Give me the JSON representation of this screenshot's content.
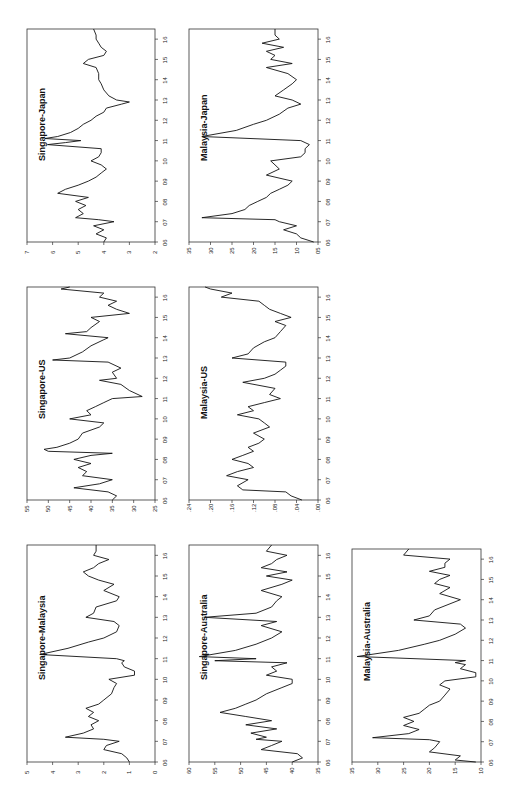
{
  "figure": {
    "orientation": "rotated-90-ccw",
    "line_color": "#111111",
    "frame_color": "#333333"
  },
  "chart_data": [
    {
      "type": "line",
      "title": "Singapore-Japan",
      "panel_box": {
        "x": 27,
        "y": 29,
        "w": 128,
        "h": 213
      },
      "ylim": [
        2,
        7
      ],
      "yticks": [
        2,
        3,
        4,
        5,
        6,
        7
      ],
      "ytick_labels": [
        "2",
        "3",
        "4",
        "5",
        "6",
        "7"
      ],
      "xlim": [
        2006,
        2016.5
      ],
      "xtick_labels": [
        "06",
        "07",
        "08",
        "09",
        "10",
        "11",
        "12",
        "13",
        "14",
        "15",
        "16"
      ],
      "x": [
        2006.0,
        2006.2,
        2006.4,
        2006.6,
        2006.8,
        2007.0,
        2007.1,
        2007.2,
        2007.4,
        2007.6,
        2007.8,
        2008.0,
        2008.2,
        2008.4,
        2008.6,
        2008.8,
        2009.0,
        2009.2,
        2009.4,
        2009.6,
        2009.8,
        2010.0,
        2010.2,
        2010.4,
        2010.6,
        2010.8,
        2010.9,
        2011.0,
        2011.1,
        2011.2,
        2011.4,
        2011.6,
        2011.8,
        2012.0,
        2012.2,
        2012.4,
        2012.6,
        2012.8,
        2012.9,
        2013.0,
        2013.2,
        2013.5,
        2013.8,
        2014.0,
        2014.3,
        2014.6,
        2014.8,
        2015.0,
        2015.2,
        2015.4,
        2015.6,
        2015.8,
        2016.0,
        2016.2,
        2016.5
      ],
      "values": [
        4.0,
        3.9,
        4.3,
        4.0,
        4.4,
        3.6,
        4.2,
        5.1,
        4.8,
        5.0,
        4.7,
        5.1,
        4.6,
        5.8,
        5.5,
        5.0,
        4.6,
        4.3,
        4.1,
        3.9,
        4.1,
        4.5,
        4.2,
        4.1,
        4.1,
        6.2,
        5.5,
        4.9,
        6.3,
        5.8,
        5.3,
        5.0,
        4.8,
        4.5,
        4.3,
        4.0,
        3.9,
        3.3,
        3.0,
        3.5,
        3.8,
        4.0,
        4.1,
        4.2,
        4.2,
        4.3,
        4.8,
        4.6,
        4.0,
        3.9,
        4.1,
        4.2,
        4.3,
        4.3,
        4.4
      ],
      "xlabel": "",
      "ylabel": ""
    },
    {
      "type": "line",
      "title": "Singapore-US",
      "panel_box": {
        "x": 27,
        "y": 287,
        "w": 128,
        "h": 213
      },
      "ylim": [
        25,
        55
      ],
      "yticks": [
        25,
        30,
        35,
        40,
        45,
        50,
        55
      ],
      "ytick_labels": [
        "25",
        "30",
        "35",
        "40",
        "45",
        "50",
        "55"
      ],
      "xlim": [
        2006,
        2016.5
      ],
      "xtick_labels": [
        "06",
        "07",
        "08",
        "09",
        "10",
        "11",
        "12",
        "13",
        "14",
        "15",
        "16"
      ],
      "x": [
        2006.0,
        2006.2,
        2006.4,
        2006.6,
        2006.8,
        2007.0,
        2007.2,
        2007.4,
        2007.6,
        2007.8,
        2008.0,
        2008.2,
        2008.3,
        2008.4,
        2008.5,
        2008.6,
        2008.8,
        2009.0,
        2009.3,
        2009.6,
        2009.8,
        2010.0,
        2010.2,
        2010.4,
        2010.6,
        2010.8,
        2011.0,
        2011.1,
        2011.4,
        2011.7,
        2011.9,
        2012.0,
        2012.3,
        2012.5,
        2012.8,
        2012.9,
        2013.0,
        2013.3,
        2013.6,
        2013.9,
        2014.0,
        2014.2,
        2014.3,
        2014.5,
        2014.8,
        2015.0,
        2015.2,
        2015.4,
        2015.6,
        2015.8,
        2016.0,
        2016.2,
        2016.4,
        2016.5
      ],
      "values": [
        35,
        34,
        36,
        44,
        38,
        35,
        42,
        41,
        43,
        40,
        44,
        40,
        35,
        50,
        51,
        48,
        45,
        43,
        42,
        38,
        37,
        45,
        40,
        41,
        39,
        37,
        35,
        28,
        31,
        33,
        38,
        34,
        35,
        33,
        36,
        49,
        45,
        42,
        40,
        37,
        36,
        46,
        41,
        40,
        38,
        40,
        31,
        34,
        36,
        34,
        38,
        37,
        47,
        45
      ],
      "xlabel": "",
      "ylabel": ""
    },
    {
      "type": "line",
      "title": "Singapore-Malaysia",
      "panel_box": {
        "x": 27,
        "y": 545,
        "w": 128,
        "h": 217
      },
      "ylim": [
        0,
        5
      ],
      "yticks": [
        0,
        1,
        2,
        3,
        4,
        5
      ],
      "ytick_labels": [
        "0",
        "1",
        "2",
        "3",
        "4",
        "5"
      ],
      "xlim": [
        2006,
        2016.5
      ],
      "xtick_labels": [
        "06",
        "07",
        "08",
        "09",
        "10",
        "11",
        "12",
        "13",
        "14",
        "15",
        "16"
      ],
      "x": [
        2006.0,
        2006.2,
        2006.4,
        2006.6,
        2006.8,
        2007.0,
        2007.1,
        2007.2,
        2007.4,
        2007.6,
        2007.8,
        2008.0,
        2008.2,
        2008.4,
        2008.6,
        2008.8,
        2009.0,
        2009.3,
        2009.6,
        2009.8,
        2010.0,
        2010.2,
        2010.4,
        2010.6,
        2010.8,
        2010.9,
        2011.0,
        2011.2,
        2011.5,
        2011.8,
        2012.0,
        2012.3,
        2012.6,
        2012.8,
        2013.0,
        2013.2,
        2013.5,
        2013.8,
        2014.0,
        2014.3,
        2014.6,
        2014.8,
        2015.0,
        2015.2,
        2015.4,
        2015.6,
        2015.8,
        2016.0,
        2016.2,
        2016.5
      ],
      "values": [
        1.0,
        1.1,
        1.3,
        2.0,
        1.9,
        1.4,
        2.0,
        3.5,
        2.8,
        2.4,
        2.5,
        2.2,
        2.6,
        2.4,
        2.7,
        2.2,
        2.0,
        1.7,
        1.6,
        1.5,
        1.8,
        0.8,
        0.8,
        1.2,
        1.3,
        1.2,
        1.5,
        4.5,
        3.4,
        2.6,
        2.0,
        1.5,
        1.4,
        1.6,
        2.7,
        2.4,
        2.3,
        1.5,
        1.4,
        2.0,
        1.6,
        2.2,
        2.6,
        2.8,
        2.4,
        2.2,
        1.8,
        2.4,
        2.3,
        2.3
      ],
      "xlabel": "",
      "ylabel": ""
    },
    {
      "type": "line",
      "title": "Malaysia-Japan",
      "panel_box": {
        "x": 189,
        "y": 29,
        "w": 129,
        "h": 213
      },
      "ylim": [
        5,
        35
      ],
      "yticks": [
        5,
        10,
        15,
        20,
        25,
        30,
        35
      ],
      "ytick_labels": [
        "05",
        "10",
        "15",
        "20",
        "25",
        "30",
        "35"
      ],
      "xlim": [
        2006,
        2016.5
      ],
      "xtick_labels": [
        "06",
        "07",
        "08",
        "09",
        "10",
        "11",
        "12",
        "13",
        "14",
        "15",
        "16"
      ],
      "x": [
        2006.0,
        2006.2,
        2006.4,
        2006.6,
        2006.8,
        2007.0,
        2007.1,
        2007.2,
        2007.4,
        2007.6,
        2007.8,
        2008.0,
        2008.2,
        2008.4,
        2008.6,
        2008.8,
        2009.0,
        2009.3,
        2009.6,
        2009.8,
        2010.0,
        2010.2,
        2010.4,
        2010.6,
        2010.8,
        2010.9,
        2011.0,
        2011.2,
        2011.5,
        2011.8,
        2012.0,
        2012.3,
        2012.6,
        2012.8,
        2013.0,
        2013.2,
        2013.5,
        2013.8,
        2014.0,
        2014.3,
        2014.6,
        2014.8,
        2015.0,
        2015.2,
        2015.4,
        2015.6,
        2015.8,
        2016.0,
        2016.2,
        2016.5
      ],
      "values": [
        6,
        9,
        10,
        13,
        10,
        14,
        15,
        32,
        25,
        22,
        21,
        19,
        17,
        16,
        14,
        12,
        11,
        17,
        14,
        15,
        16,
        9,
        8,
        8,
        7,
        8,
        9,
        32,
        24,
        20,
        17,
        14,
        12,
        9,
        11,
        15,
        13,
        11,
        10,
        12,
        17,
        11,
        16,
        15,
        17,
        13,
        18,
        14,
        15,
        15
      ],
      "xlabel": "",
      "ylabel": ""
    },
    {
      "type": "line",
      "title": "Malaysia-US",
      "panel_box": {
        "x": 189,
        "y": 287,
        "w": 129,
        "h": 213
      },
      "ylim": [
        0,
        24
      ],
      "yticks": [
        0,
        4,
        8,
        12,
        16,
        20,
        24
      ],
      "ytick_labels": [
        ".00",
        ".04",
        ".08",
        ".12",
        ".16",
        ".20",
        ".24"
      ],
      "xlim": [
        2006,
        2016.5
      ],
      "xtick_labels": [
        "06",
        "07",
        "08",
        "09",
        "10",
        "11",
        "12",
        "13",
        "14",
        "15",
        "16"
      ],
      "x": [
        2006.0,
        2006.2,
        2006.4,
        2006.5,
        2006.7,
        2007.0,
        2007.2,
        2007.4,
        2007.6,
        2007.8,
        2008.0,
        2008.2,
        2008.4,
        2008.6,
        2008.8,
        2009.0,
        2009.3,
        2009.6,
        2009.8,
        2010.0,
        2010.2,
        2010.4,
        2010.6,
        2010.8,
        2011.0,
        2011.2,
        2011.5,
        2011.8,
        2012.0,
        2012.2,
        2012.4,
        2012.6,
        2012.8,
        2013.0,
        2013.2,
        2013.5,
        2013.8,
        2014.0,
        2014.3,
        2014.6,
        2014.8,
        2015.0,
        2015.2,
        2015.4,
        2015.6,
        2015.8,
        2016.0,
        2016.2,
        2016.4,
        2016.5
      ],
      "values": [
        3,
        5,
        6,
        14,
        15,
        13,
        17,
        15,
        12,
        13,
        16,
        14,
        12,
        13,
        11,
        10,
        12,
        9,
        10,
        11,
        15,
        12,
        13,
        10,
        7,
        9,
        8,
        14,
        10,
        8,
        7,
        6,
        6,
        16,
        13,
        12,
        10,
        8,
        7,
        6,
        8,
        5,
        7,
        9,
        10,
        11,
        18,
        16,
        20,
        21
      ],
      "xlabel": "",
      "ylabel": ""
    },
    {
      "type": "line",
      "title": "Singapore-Australia",
      "panel_box": {
        "x": 189,
        "y": 545,
        "w": 129,
        "h": 217
      },
      "ylim": [
        35,
        60
      ],
      "yticks": [
        35,
        40,
        45,
        50,
        55,
        60
      ],
      "ytick_labels": [
        "35",
        "40",
        "45",
        "50",
        "55",
        "60"
      ],
      "xlim": [
        2006,
        2016.5
      ],
      "xtick_labels": [
        "06",
        "07",
        "08",
        "09",
        "10",
        "11",
        "12",
        "13",
        "14",
        "15",
        "16"
      ],
      "x": [
        2006.0,
        2006.2,
        2006.4,
        2006.6,
        2006.8,
        2007.0,
        2007.1,
        2007.2,
        2007.4,
        2007.6,
        2007.8,
        2008.0,
        2008.2,
        2008.4,
        2008.6,
        2008.8,
        2009.0,
        2009.3,
        2009.6,
        2009.8,
        2010.0,
        2010.2,
        2010.4,
        2010.6,
        2010.8,
        2010.9,
        2011.0,
        2011.1,
        2011.4,
        2011.7,
        2012.0,
        2012.3,
        2012.6,
        2012.8,
        2013.0,
        2013.2,
        2013.5,
        2013.8,
        2014.0,
        2014.3,
        2014.6,
        2014.8,
        2015.0,
        2015.2,
        2015.4,
        2015.6,
        2015.8,
        2016.0,
        2016.2,
        2016.5
      ],
      "values": [
        40,
        38,
        39,
        46,
        44,
        42,
        47,
        45,
        48,
        43,
        49,
        44,
        49,
        54,
        51,
        49,
        47,
        45,
        42,
        40,
        40,
        45,
        43,
        44,
        41,
        55,
        47,
        58,
        51,
        47,
        44,
        42,
        46,
        43,
        57,
        47,
        44,
        43,
        42,
        46,
        42,
        40,
        45,
        41,
        46,
        44,
        43,
        41,
        45,
        44
      ],
      "xlabel": "",
      "ylabel": ""
    },
    {
      "type": "line",
      "title": "Malaysia-Australia",
      "panel_box": {
        "x": 352,
        "y": 549,
        "w": 129,
        "h": 213
      },
      "ylim": [
        10,
        35
      ],
      "yticks": [
        10,
        15,
        20,
        25,
        30,
        35
      ],
      "ytick_labels": [
        "10",
        "15",
        "20",
        "25",
        "30",
        "35"
      ],
      "xlim": [
        2006,
        2016.5
      ],
      "xtick_labels": [
        "06",
        "07",
        "08",
        "09",
        "10",
        "11",
        "12",
        "13",
        "14",
        "15",
        "16"
      ],
      "x": [
        2006.0,
        2006.1,
        2006.3,
        2006.5,
        2006.7,
        2007.0,
        2007.1,
        2007.2,
        2007.4,
        2007.6,
        2007.8,
        2008.0,
        2008.2,
        2008.4,
        2008.6,
        2008.8,
        2009.0,
        2009.3,
        2009.6,
        2009.8,
        2010.0,
        2010.2,
        2010.4,
        2010.6,
        2010.8,
        2010.9,
        2011.0,
        2011.2,
        2011.5,
        2011.8,
        2012.0,
        2012.3,
        2012.6,
        2012.8,
        2013.0,
        2013.2,
        2013.5,
        2013.8,
        2014.0,
        2014.3,
        2014.6,
        2014.8,
        2015.0,
        2015.2,
        2015.4,
        2015.6,
        2015.8,
        2016.0,
        2016.2,
        2016.5
      ],
      "values": [
        11,
        15,
        14,
        20,
        19,
        18,
        20,
        31,
        24,
        22,
        25,
        23,
        25,
        22,
        21,
        20,
        18,
        17,
        16,
        18,
        17,
        11,
        11,
        14,
        13,
        15,
        13,
        34,
        26,
        21,
        18,
        15,
        13,
        14,
        23,
        20,
        19,
        16,
        14,
        18,
        16,
        19,
        18,
        16,
        20,
        17,
        17,
        16,
        25,
        24
      ],
      "xlabel": "",
      "ylabel": ""
    }
  ],
  "caption": {
    "text": ""
  }
}
